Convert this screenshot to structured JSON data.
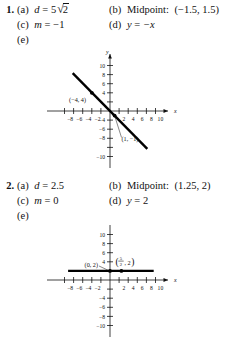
{
  "page": {
    "background": "#ffffff",
    "ink": "#111111"
  },
  "problems": [
    {
      "number": "1.",
      "parts": {
        "a_tag": "(a)",
        "a_var": "d",
        "a_eq": "=",
        "a_coef": "5",
        "a_radical_sym": "√",
        "a_radicand": "2",
        "b_tag": "(b)",
        "b_label": "Midpoint:",
        "b_value": "(−1.5, 1.5)",
        "c_tag": "(c)",
        "c_var": "m",
        "c_eq": "=",
        "c_value": "−1",
        "d_tag": "(d)",
        "d_lhs": "y",
        "d_eq": "=",
        "d_rhs": "−x",
        "e_tag": "(e)"
      },
      "graph": {
        "type": "line",
        "x_axis_name": "x",
        "y_axis_name": "y",
        "xlim": [
          -11,
          11
        ],
        "ylim": [
          -11,
          11
        ],
        "x_ticks": [
          -10,
          -8,
          -6,
          -4,
          -2,
          2,
          4,
          6,
          8,
          10
        ],
        "x_tick_labels": [
          "",
          "−8",
          "−6",
          "−4",
          "−2",
          "2",
          "4",
          "6",
          "8",
          "10"
        ],
        "y_ticks": [
          -10,
          -8,
          -6,
          -4,
          -2,
          2,
          4,
          6,
          8,
          10
        ],
        "y_tick_labels": [
          "−10",
          "−8",
          "−6",
          "−4",
          "",
          "",
          "4",
          "6",
          "8",
          "10"
        ],
        "grid": false,
        "equation": "y = -x",
        "slope": -1,
        "intercept": 0,
        "segment_x": [
          -8.2,
          8.2
        ],
        "points": [
          {
            "label": "(−4, 4)",
            "x": -4,
            "y": 4
          },
          {
            "label": "(1, −1)",
            "x": 1,
            "y": -1
          }
        ]
      }
    },
    {
      "number": "2.",
      "parts": {
        "a_tag": "(a)",
        "a_var": "d",
        "a_eq": "=",
        "a_value": "2.5",
        "b_tag": "(b)",
        "b_label": "Midpoint:",
        "b_value": "(1.25, 2)",
        "c_tag": "(c)",
        "c_var": "m",
        "c_eq": "=",
        "c_value": "0",
        "d_tag": "(d)",
        "d_lhs": "y",
        "d_eq": "=",
        "d_rhs": "2",
        "e_tag": "(e)"
      },
      "graph": {
        "type": "line",
        "x_axis_name": "x",
        "y_axis_name": "y",
        "xlim": [
          -11,
          11
        ],
        "ylim": [
          -11,
          11
        ],
        "x_ticks": [
          -10,
          -8,
          -6,
          -4,
          -2,
          2,
          4,
          6,
          8,
          10
        ],
        "x_tick_labels": [
          "",
          "−8",
          "−6",
          "−4",
          "−2",
          "2",
          "4",
          "6",
          "8",
          "10"
        ],
        "y_ticks": [
          -10,
          -8,
          -6,
          -4,
          -2,
          2,
          4,
          6,
          8,
          10
        ],
        "y_tick_labels": [
          "−10",
          "−8",
          "−6",
          "−4",
          "",
          "",
          "4",
          "6",
          "8",
          "10"
        ],
        "grid": false,
        "equation": "y = 2",
        "slope": 0,
        "intercept": 2,
        "segment_x": [
          -9.2,
          9.6
        ],
        "points": [
          {
            "label": "(0, 2)",
            "x": 0,
            "y": 2
          },
          {
            "label_numerator": "5",
            "label_denominator": "2",
            "label_second": "2",
            "x": 2.5,
            "y": 2
          }
        ]
      }
    }
  ]
}
